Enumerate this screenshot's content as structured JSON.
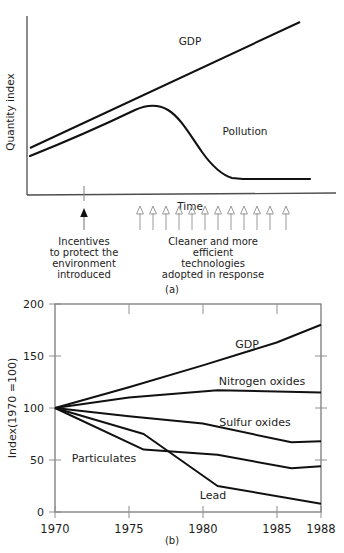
{
  "figure": {
    "panel_a_caption": "(a)",
    "panel_b_caption": "(b)"
  },
  "chart_data": [
    {
      "type": "line",
      "panel": "(a)",
      "title": "",
      "xlabel": "Time",
      "ylabel": "Quantity index",
      "grid": false,
      "axes_style": "open",
      "legend_position": "inline-labels",
      "series": [
        {
          "name": "GDP",
          "label": "GDP",
          "shape": "straight rising line",
          "points": [
            [
              0,
              22
            ],
            [
              100,
              96
            ]
          ]
        },
        {
          "name": "Pollution",
          "label": "Pollution",
          "shape": "inverted-U: rises, peaks, declines, flattens",
          "points": [
            [
              0,
              16
            ],
            [
              20,
              35
            ],
            [
              40,
              56
            ],
            [
              50,
              62
            ],
            [
              58,
              63
            ],
            [
              66,
              60
            ],
            [
              75,
              48
            ],
            [
              85,
              32
            ],
            [
              92,
              25
            ],
            [
              96,
              24
            ],
            [
              100,
              24
            ]
          ]
        }
      ],
      "annotations": [
        {
          "name": "incentives-annotation",
          "arrow": "solid-up-arrow",
          "x_position_pct": 28,
          "lines": [
            "Incentives",
            "to protect the",
            "environment",
            "introduced"
          ]
        },
        {
          "name": "technologies-annotation",
          "arrow": "hollow-up-arrows",
          "arrow_count": 12,
          "x_start_pct": 44,
          "x_end_pct": 94,
          "lines": [
            "Cleaner and more",
            "efficient",
            "technologies",
            "adopted in response"
          ]
        }
      ]
    },
    {
      "type": "line",
      "panel": "(b)",
      "title": "",
      "xlabel": "",
      "ylabel": "Index(1970 =100)",
      "xlim": [
        1970,
        1988
      ],
      "ylim": [
        0,
        200
      ],
      "xticks": [
        1970,
        1975,
        1980,
        1985,
        1988
      ],
      "xtick_labels": [
        "1970",
        "1975",
        "1980",
        "1985",
        "1988"
      ],
      "yticks": [
        0,
        50,
        100,
        150,
        200
      ],
      "ytick_labels": [
        "0",
        "50",
        "100",
        "150",
        "200"
      ],
      "grid": false,
      "legend_position": "inline-labels",
      "series": [
        {
          "name": "GDP",
          "label": "GDP",
          "label_x": 1983.0,
          "label_y": 163,
          "x": [
            1970,
            1975,
            1980,
            1985,
            1988
          ],
          "values": [
            100,
            120,
            141,
            163,
            180
          ]
        },
        {
          "name": "Nitrogen oxides",
          "label": "Nitrogen oxides",
          "label_x": 1983.2,
          "label_y": 128,
          "x": [
            1970,
            1975,
            1981,
            1988
          ],
          "values": [
            100,
            110,
            117,
            115
          ]
        },
        {
          "name": "Sulfur oxides",
          "label": "Sulfur oxides",
          "label_x": 1983.0,
          "label_y": 88,
          "x": [
            1970,
            1975,
            1980,
            1986,
            1988
          ],
          "values": [
            100,
            92,
            85,
            67,
            68
          ]
        },
        {
          "name": "Particulates",
          "label": "Particulates",
          "label_x": 1972.0,
          "label_y": 52,
          "x": [
            1970,
            1976,
            1981,
            1986,
            1988
          ],
          "values": [
            100,
            60,
            55,
            42,
            44
          ]
        },
        {
          "name": "Lead",
          "label": "Lead",
          "label_x": 1980.4,
          "label_y": 14,
          "x": [
            1970,
            1976,
            1981,
            1988
          ],
          "values": [
            100,
            75,
            25,
            8
          ]
        }
      ]
    }
  ]
}
